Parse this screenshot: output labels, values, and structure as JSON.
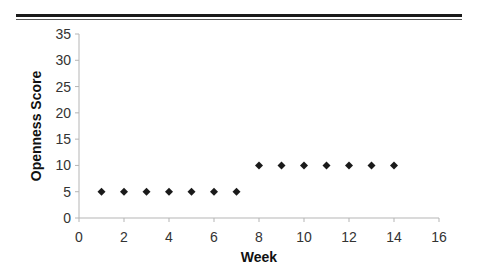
{
  "chart_data": {
    "type": "scatter",
    "title": "",
    "xlabel": "Week",
    "ylabel": "Openness Score",
    "xlim": [
      0,
      16
    ],
    "ylim": [
      0,
      35
    ],
    "xticks": [
      0,
      2,
      4,
      6,
      8,
      10,
      12,
      14,
      16
    ],
    "yticks": [
      0,
      5,
      10,
      15,
      20,
      25,
      30,
      35
    ],
    "grid": false,
    "legend": null,
    "marker": "diamond",
    "marker_color": "#1a1a1a",
    "series": [
      {
        "name": "Openness Score",
        "x": [
          1,
          2,
          3,
          4,
          5,
          6,
          7,
          8,
          9,
          10,
          11,
          12,
          13,
          14
        ],
        "y": [
          5,
          5,
          5,
          5,
          5,
          5,
          5,
          10,
          10,
          10,
          10,
          10,
          10,
          10
        ]
      }
    ]
  }
}
